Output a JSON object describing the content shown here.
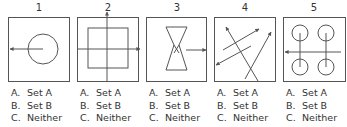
{
  "panels": [
    {
      "number": "1",
      "figure": "circle-with-left-arrow-from-center",
      "options": [
        {
          "letter": "A.",
          "label": "Set A"
        },
        {
          "letter": "B.",
          "label": "Set B"
        },
        {
          "letter": "C.",
          "label": "Neither"
        }
      ]
    },
    {
      "number": "2",
      "figure": "square-with-crossing-axes-arrows-up-right",
      "options": [
        {
          "letter": "A.",
          "label": "Set A"
        },
        {
          "letter": "B.",
          "label": "Set B"
        },
        {
          "letter": "C.",
          "label": "Neither"
        }
      ]
    },
    {
      "number": "3",
      "figure": "hourglass-with-right-arrow",
      "options": [
        {
          "letter": "A.",
          "label": "Set A"
        },
        {
          "letter": "B.",
          "label": "Set B"
        },
        {
          "letter": "C.",
          "label": "Neither"
        }
      ]
    },
    {
      "number": "4",
      "figure": "four-diagonal-arrows",
      "options": [
        {
          "letter": "A.",
          "label": "Set A"
        },
        {
          "letter": "B.",
          "label": "Set B"
        },
        {
          "letter": "C.",
          "label": "Neither"
        }
      ]
    },
    {
      "number": "5",
      "figure": "four-circles-with-left-arrow",
      "options": [
        {
          "letter": "A.",
          "label": "Set A"
        },
        {
          "letter": "B.",
          "label": "Set B"
        },
        {
          "letter": "C.",
          "label": "Neither"
        }
      ]
    }
  ],
  "colors": {
    "stroke": "#555555",
    "text": "#333333"
  }
}
